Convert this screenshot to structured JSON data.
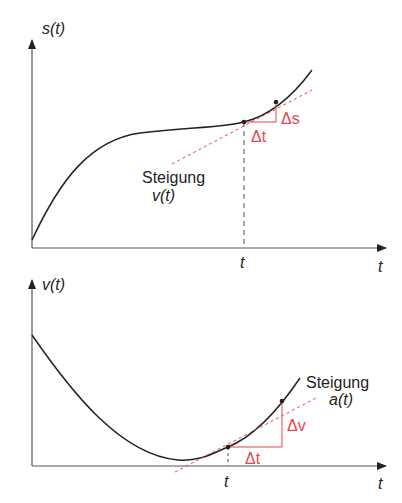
{
  "top_graph": {
    "y_label": "s(t)",
    "x_label": "t",
    "tick_label": "t",
    "slope_label_line1": "Steigung",
    "slope_label_line2": "v(t)",
    "delta_x": "Δt",
    "delta_y": "Δs"
  },
  "bottom_graph": {
    "y_label": "v(t)",
    "x_label": "t",
    "tick_label": "t",
    "slope_label_line1": "Steigung",
    "slope_label_line2": "a(t)",
    "delta_x": "Δt",
    "delta_y": "Δv"
  },
  "colors": {
    "curve": "#222222",
    "axis": "#555555",
    "tangent": "#e8454f"
  }
}
